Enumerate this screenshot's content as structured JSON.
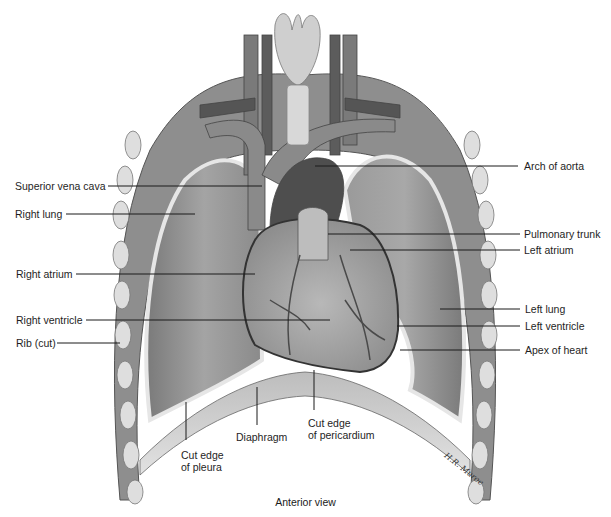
{
  "figure": {
    "caption": "Anterior view",
    "artist_signature": "H.R. Muroe"
  },
  "labels": {
    "left": [
      {
        "id": "superior-vena-cava",
        "text": "Superior vena cava"
      },
      {
        "id": "right-lung",
        "text": "Right lung"
      },
      {
        "id": "right-atrium",
        "text": "Right atrium"
      },
      {
        "id": "right-ventricle",
        "text": "Right ventricle"
      },
      {
        "id": "rib-cut",
        "text": "Rib (cut)"
      }
    ],
    "right": [
      {
        "id": "arch-of-aorta",
        "text": "Arch of aorta"
      },
      {
        "id": "pulmonary-trunk",
        "text": "Pulmonary trunk"
      },
      {
        "id": "left-atrium",
        "text": "Left atrium"
      },
      {
        "id": "left-lung",
        "text": "Left lung"
      },
      {
        "id": "left-ventricle",
        "text": "Left ventricle"
      },
      {
        "id": "apex-of-heart",
        "text": "Apex of heart"
      }
    ],
    "bottom": [
      {
        "id": "cut-edge-pleura",
        "line1": "Cut edge",
        "line2": "of pleura"
      },
      {
        "id": "diaphragm",
        "text": "Diaphragm"
      },
      {
        "id": "cut-edge-pericardium",
        "line1": "Cut edge",
        "line2": "of pericardium"
      }
    ]
  },
  "colors": {
    "background": "#ffffff",
    "leader_line": "#1a1a1a",
    "lung": "#8f8f8f",
    "rib": "#d9d9d9",
    "heart": "#a8a8a8",
    "vessel": "#6b6b6b",
    "diaphragm": "#c4c4c4"
  }
}
